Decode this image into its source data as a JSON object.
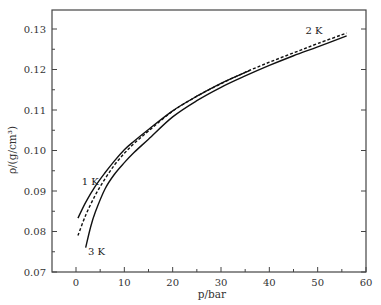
{
  "chart_data": {
    "type": "line",
    "title": "",
    "xlabel": "p/bar",
    "ylabel": "ρ/(g/cm³)",
    "xlim": [
      -5,
      60
    ],
    "ylim": [
      0.07,
      0.135
    ],
    "xticks": [
      0,
      10,
      20,
      30,
      40,
      50,
      60
    ],
    "yticks": [
      0.07,
      0.08,
      0.09,
      0.1,
      0.11,
      0.12,
      0.13
    ],
    "xtick_labels": [
      "0",
      "10",
      "20",
      "30",
      "40",
      "50",
      "60"
    ],
    "ytick_labels": [
      "0.07",
      "0.08",
      "0.09",
      "0.10",
      "0.11",
      "0.12",
      "0.13"
    ],
    "grid": false,
    "legend": "inline labels",
    "series": [
      {
        "name": "1 K",
        "style": "solid",
        "label_pos": [
          1.2,
          0.0915
        ],
        "x": [
          0.4,
          2,
          4,
          6,
          8,
          10,
          12,
          15,
          20,
          25,
          30,
          36
        ],
        "y": [
          0.0833,
          0.0872,
          0.0912,
          0.0945,
          0.0975,
          0.1002,
          0.1023,
          0.1052,
          0.1098,
          0.1134,
          0.1166,
          0.1198
        ]
      },
      {
        "name": "2 K",
        "style": "dashed",
        "label_pos": [
          47.5,
          0.1288
        ],
        "x": [
          0.4,
          2,
          4,
          6,
          8,
          10,
          12,
          15,
          20,
          25,
          30,
          35,
          40,
          45,
          50,
          56
        ],
        "y": [
          0.079,
          0.084,
          0.089,
          0.093,
          0.0965,
          0.0993,
          0.1017,
          0.1048,
          0.1097,
          0.1134,
          0.1165,
          0.1193,
          0.1218,
          0.1241,
          0.1264,
          0.129
        ]
      },
      {
        "name": "3 K",
        "style": "solid",
        "label_pos": [
          2.5,
          0.0743
        ],
        "x": [
          2,
          3,
          4,
          6,
          8,
          10,
          12,
          15,
          20,
          25,
          30,
          35,
          40,
          45,
          50,
          56
        ],
        "y": [
          0.076,
          0.081,
          0.0848,
          0.0905,
          0.0942,
          0.097,
          0.0995,
          0.1028,
          0.1083,
          0.1123,
          0.1156,
          0.1184,
          0.121,
          0.1234,
          0.1256,
          0.1283
        ]
      }
    ]
  }
}
